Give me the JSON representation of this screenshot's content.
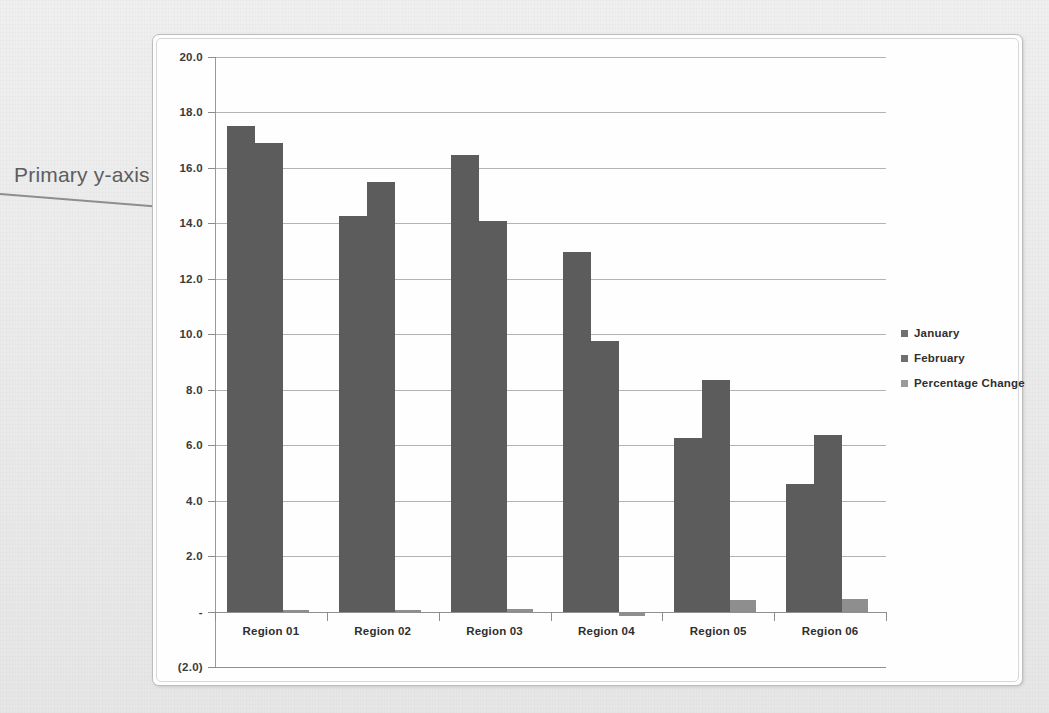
{
  "annotation": {
    "text": "Primary y-axis",
    "arrow_icon": "arrow-right-icon"
  },
  "chart_data": {
    "type": "bar",
    "title": "",
    "subtitle": "",
    "xlabel": "",
    "ylabel": "",
    "categories": [
      "Region 01",
      "Region 02",
      "Region 03",
      "Region 04",
      "Region 05",
      "Region 06"
    ],
    "series": [
      {
        "name": "January",
        "values": [
          17.5,
          14.25,
          16.45,
          12.95,
          6.25,
          4.6
        ],
        "color": "#5c5c5c"
      },
      {
        "name": "February",
        "values": [
          16.9,
          15.5,
          14.1,
          9.75,
          8.35,
          6.35
        ],
        "color": "#5c5c5c"
      },
      {
        "name": "Percentage Change",
        "values": [
          0.05,
          0.05,
          0.1,
          -0.15,
          0.4,
          0.45
        ],
        "color": "#8e8e8e"
      }
    ],
    "ylim": [
      -2.0,
      20.0
    ],
    "ytick_values": [
      20.0,
      18.0,
      16.0,
      14.0,
      12.0,
      10.0,
      8.0,
      6.0,
      4.0,
      2.0,
      0.0,
      -2.0
    ],
    "ytick_labels": [
      "20.0",
      "18.0",
      "16.0",
      "14.0",
      "12.0",
      "10.0",
      "8.0",
      "6.0",
      "4.0",
      "2.0",
      "-",
      "(2.0)"
    ],
    "grid": true,
    "legend_position": "right",
    "legend": [
      "January",
      "February",
      "Percentage Change"
    ]
  },
  "colors": {
    "background": "#eceded",
    "plot_background": "#fefefe",
    "bar_primary": "#5c5c5c",
    "bar_tertiary": "#8e8e8e",
    "gridline": "#9e9e9e",
    "annotation_text": "#5d5d5d"
  }
}
